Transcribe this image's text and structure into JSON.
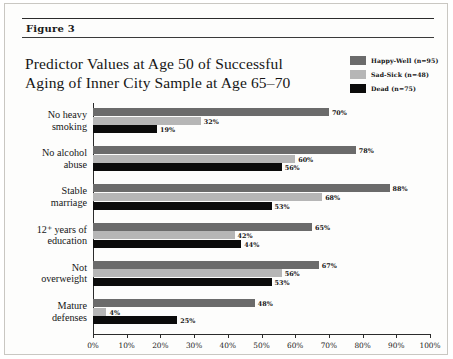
{
  "figure": {
    "label": "Figure 3",
    "title_line1": "Predictor Values at Age 50 of Successful",
    "title_line2": "Aging of Inner City Sample at Age 65–70"
  },
  "legend": {
    "items": [
      {
        "label": "Happy-Well (n=95)",
        "color": "#6b6b6b",
        "swatch_name": "legend-swatch-happy-well"
      },
      {
        "label": "Sad-Sick (n=48)",
        "color": "#b6b6b6",
        "swatch_name": "legend-swatch-sad-sick"
      },
      {
        "label": "Dead (n=75)",
        "color": "#0b0b0b",
        "swatch_name": "legend-swatch-dead"
      }
    ]
  },
  "axis": {
    "ticks": [
      "0%",
      "10%",
      "20%",
      "30%",
      "40%",
      "50%",
      "60%",
      "70%",
      "80%",
      "90%",
      "100%"
    ]
  },
  "categories_display": [
    {
      "line1": "No heavy",
      "line2": "smoking"
    },
    {
      "line1": "No alcohol",
      "line2": "abuse"
    },
    {
      "line1": "Stable",
      "line2": "marriage"
    },
    {
      "line1": "12⁺ years of",
      "line2": "education"
    },
    {
      "line1": "Not",
      "line2": "overweight"
    },
    {
      "line1": "Mature",
      "line2": "defenses"
    }
  ],
  "bar_labels": {
    "g0": {
      "hw": "70%",
      "ss": "32%",
      "dd": "19%"
    },
    "g1": {
      "hw": "78%",
      "ss": "60%",
      "dd": "56%"
    },
    "g2": {
      "hw": "88%",
      "ss": "68%",
      "dd": "53%"
    },
    "g3": {
      "hw": "65%",
      "ss": "42%",
      "dd": "44%"
    },
    "g4": {
      "hw": "67%",
      "ss": "56%",
      "dd": "53%"
    },
    "g5": {
      "hw": "48%",
      "ss": "4%",
      "dd": "25%"
    }
  },
  "chart_data": {
    "type": "bar",
    "orientation": "horizontal",
    "title": "Predictor Values at Age 50 of Successful Aging of Inner City Sample at Age 65–70",
    "xlabel": "",
    "ylabel": "",
    "xlim": [
      0,
      100
    ],
    "xticks": [
      0,
      10,
      20,
      30,
      40,
      50,
      60,
      70,
      80,
      90,
      100
    ],
    "xtick_labels": [
      "0%",
      "10%",
      "20%",
      "30%",
      "40%",
      "50%",
      "60%",
      "70%",
      "80%",
      "90%",
      "100%"
    ],
    "grid": false,
    "legend_position": "top-right",
    "value_unit": "percent",
    "categories": [
      "No heavy smoking",
      "No alcohol abuse",
      "Stable marriage",
      "12+ years of education",
      "Not overweight",
      "Mature defenses"
    ],
    "series": [
      {
        "name": "Happy-Well (n=95)",
        "color": "#6b6b6b",
        "values": [
          70,
          78,
          88,
          65,
          67,
          48
        ]
      },
      {
        "name": "Sad-Sick (n=48)",
        "color": "#b6b6b6",
        "values": [
          32,
          60,
          68,
          42,
          56,
          4
        ]
      },
      {
        "name": "Dead (n=75)",
        "color": "#0b0b0b",
        "values": [
          19,
          56,
          53,
          44,
          53,
          25
        ]
      }
    ]
  }
}
